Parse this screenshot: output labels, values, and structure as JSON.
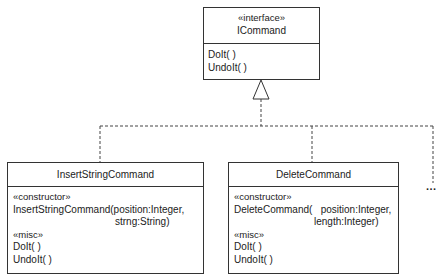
{
  "diagram": {
    "type": "UML class diagram",
    "interface": {
      "stereotype": "«interface»",
      "name": "ICommand",
      "operations": [
        "DoIt( )",
        "UndoIt( )"
      ]
    },
    "classes": [
      {
        "name": "InsertStringCommand",
        "constructor_stereotype": "«constructor»",
        "constructor_line1": "InsertStringCommand(position:Integer,",
        "constructor_line2": "strng:String)",
        "misc_stereotype": "«misc»",
        "operations": [
          "DoIt( )",
          "UndoIt( )"
        ]
      },
      {
        "name": "DeleteCommand",
        "constructor_stereotype": "«constructor»",
        "constructor_line1": "DeleteCommand(   position:Integer,",
        "constructor_line2": "length:Integer)",
        "misc_stereotype": "«misc»",
        "operations": [
          "DoIt( )",
          "UndoIt( )"
        ]
      }
    ],
    "more_indicator": "...",
    "relationship": "realization (dashed line with hollow triangle)",
    "colors": {
      "line": "#333333",
      "background": "#ffffff",
      "text": "#222222"
    }
  }
}
